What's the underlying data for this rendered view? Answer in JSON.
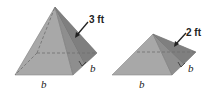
{
  "figures": [
    {
      "id": "pyramid-large",
      "slant_height_label": "3 ft",
      "base_front_label": "b",
      "base_side_label": "b"
    },
    {
      "id": "pyramid-small",
      "slant_height_label": "2 ft",
      "base_front_label": "b",
      "base_side_label": "b"
    }
  ],
  "colors": {
    "front_face": "#a9a9a9",
    "side_face": "#8c8c8c",
    "dark_face": "#7a7a7a",
    "edge": "#6a6a6a",
    "text": "#222222"
  }
}
